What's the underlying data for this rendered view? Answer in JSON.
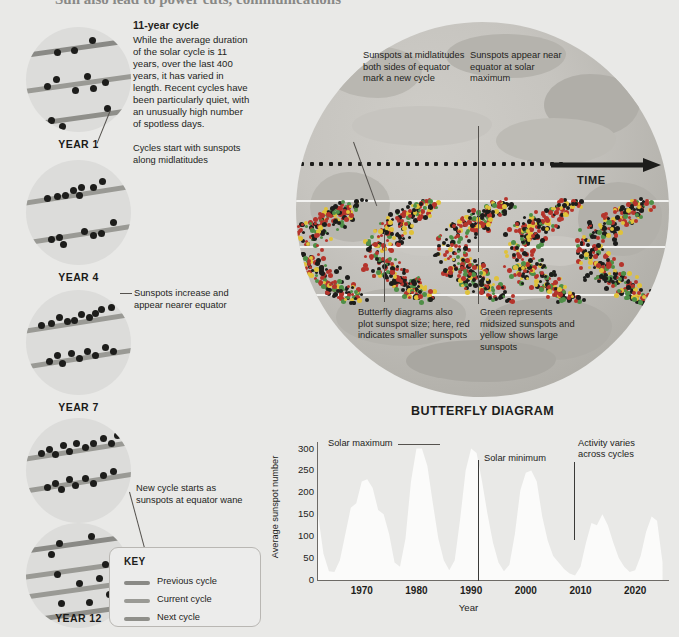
{
  "page": {
    "cropped_headline": "Sun also lead to power cuts, communications"
  },
  "intro": {
    "heading": "11-year cycle",
    "body": "While the average duration of the solar cycle is 11 years, over the last 400 years, it has varied in length. Recent cycles have been particularly quiet, with an unusually high number of spotless days."
  },
  "year_panels": [
    {
      "label": "YEAR 1",
      "bands": 3
    },
    {
      "label": "YEAR 4",
      "bands": 2
    },
    {
      "label": "YEAR 7",
      "bands": 2
    },
    {
      "label": "YEAR 10",
      "bands": 2
    },
    {
      "label": "YEAR 12",
      "bands": 4
    }
  ],
  "left_annotations": [
    {
      "id": "year1-note",
      "text": "Cycles start with sunspots along midlatitudes"
    },
    {
      "id": "year7-note",
      "text": "Sunspots increase and appear nearer equator"
    },
    {
      "id": "year12-note",
      "text": "New cycle starts as sunspots at equator wane"
    }
  ],
  "key": {
    "title": "KEY",
    "items": [
      {
        "label": "Previous cycle",
        "color": "#8a8a86"
      },
      {
        "label": "Current cycle",
        "color": "#9a9a95"
      },
      {
        "label": "Next cycle",
        "color": "#8f8f8a"
      }
    ]
  },
  "butterfly": {
    "title": "BUTTERFLY DIAGRAM",
    "time_axis_label": "TIME",
    "annotations": [
      {
        "id": "midlatitude-note",
        "text": "Sunspots at midlatitudes both sides of equator mark a new cycle"
      },
      {
        "id": "equator-note",
        "text": "Sunspots appear near equator at solar maximum"
      },
      {
        "id": "size-note",
        "text": "Butterfly diagrams also plot sunspot size; here, red indicates smaller sunspots"
      },
      {
        "id": "color-note",
        "text": "Green represents midsized sunspots and yellow shows large sunspots"
      }
    ],
    "spot_colors": {
      "small": "#b5342c",
      "midsized": "#4f8f47",
      "large": "#e0c23a"
    }
  },
  "chart_data": {
    "type": "area",
    "title": "BUTTERFLY DIAGRAM",
    "xlabel": "Year",
    "ylabel": "Average sunspot number",
    "xlim": [
      1962,
      2026
    ],
    "ylim": [
      0,
      315
    ],
    "yticks": [
      0,
      50,
      100,
      150,
      200,
      250,
      300
    ],
    "xticks": [
      1970,
      1980,
      1990,
      2000,
      2010,
      2020
    ],
    "grid": false,
    "legend": "none",
    "annotations": [
      {
        "text": "Solar maximum",
        "at_year": 1982,
        "at_value": 310
      },
      {
        "text": "Solar minimum",
        "at_year": 1999,
        "at_value": 255
      },
      {
        "text": "Activity varies across cycles",
        "at_year": 2017,
        "at_value": 290
      }
    ],
    "x": [
      1962,
      1963,
      1964,
      1965,
      1966,
      1967,
      1968,
      1969,
      1970,
      1971,
      1972,
      1973,
      1974,
      1975,
      1976,
      1977,
      1978,
      1979,
      1980,
      1981,
      1982,
      1983,
      1984,
      1985,
      1986,
      1987,
      1988,
      1989,
      1990,
      1991,
      1992,
      1993,
      1994,
      1995,
      1996,
      1997,
      1998,
      1999,
      2000,
      2001,
      2002,
      2003,
      2004,
      2005,
      2006,
      2007,
      2008,
      2009,
      2010,
      2011,
      2012,
      2013,
      2014,
      2015,
      2016,
      2017,
      2018,
      2019,
      2020,
      2021,
      2022,
      2023,
      2024,
      2025
    ],
    "values": [
      150,
      60,
      20,
      18,
      45,
      105,
      165,
      175,
      225,
      230,
      210,
      160,
      150,
      105,
      40,
      30,
      95,
      225,
      300,
      300,
      260,
      175,
      95,
      45,
      22,
      45,
      140,
      250,
      300,
      290,
      225,
      150,
      85,
      40,
      20,
      35,
      105,
      205,
      245,
      250,
      225,
      145,
      90,
      55,
      40,
      25,
      15,
      10,
      30,
      85,
      130,
      125,
      150,
      125,
      85,
      50,
      30,
      18,
      22,
      55,
      110,
      145,
      135,
      40
    ]
  }
}
